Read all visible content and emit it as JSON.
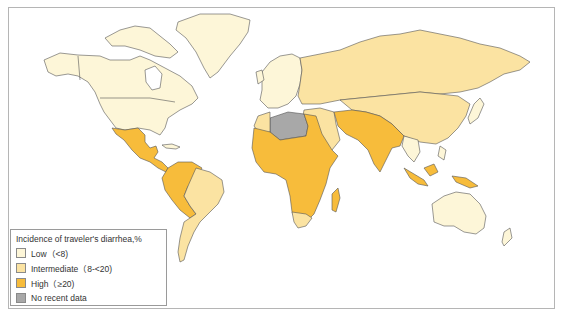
{
  "map": {
    "title": "Incidence of traveler's diarrhea by region",
    "colors": {
      "low": "#fdf6d8",
      "intermediate": "#fbe3a2",
      "high": "#f7bc3b",
      "no_data": "#a8a8a8",
      "border": "#555555",
      "ocean": "#ffffff"
    },
    "regions": [
      {
        "name": "North America (USA, Canada)",
        "category": "low"
      },
      {
        "name": "Greenland",
        "category": "low"
      },
      {
        "name": "Mexico & Central America",
        "category": "high"
      },
      {
        "name": "Northern South America (Colombia, Venezuela, Peru, Ecuador, Bolivia)",
        "category": "high"
      },
      {
        "name": "Brazil, Argentina, Chile, Uruguay",
        "category": "intermediate"
      },
      {
        "name": "Western & Northern Europe",
        "category": "low"
      },
      {
        "name": "Eastern Europe & Russia",
        "category": "intermediate"
      },
      {
        "name": "Algeria & Libya",
        "category": "no_data"
      },
      {
        "name": "Sub-Saharan Africa",
        "category": "high"
      },
      {
        "name": "South Africa",
        "category": "intermediate"
      },
      {
        "name": "Middle East",
        "category": "intermediate"
      },
      {
        "name": "South Asia (India, Pakistan, Iran, Afghanistan)",
        "category": "high"
      },
      {
        "name": "China & Central Asia",
        "category": "intermediate"
      },
      {
        "name": "Japan & Korea",
        "category": "low"
      },
      {
        "name": "Southeast Asia (Indonesia, Papua New Guinea)",
        "category": "high"
      },
      {
        "name": "Australia & New Zealand",
        "category": "low"
      }
    ]
  },
  "legend": {
    "title": "Incidence of traveler's diarrhea,%",
    "items": [
      {
        "label": "Low（<8)",
        "color": "#fdf6d8"
      },
      {
        "label": "Intermediate（8-<20)",
        "color": "#fbe3a2"
      },
      {
        "label": "High（≥20)",
        "color": "#f7bc3b"
      },
      {
        "label": "No recent data",
        "color": "#a8a8a8"
      }
    ]
  }
}
